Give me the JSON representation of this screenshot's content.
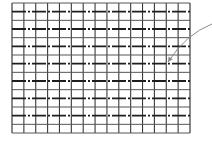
{
  "diagram": {
    "type": "grid-with-pointer-arrow",
    "canvas": {
      "width": 212,
      "height": 142,
      "background": "#ffffff"
    },
    "grid": {
      "left": 12,
      "top": 3,
      "right": 190,
      "bottom": 133,
      "columns": 15,
      "rows": 15,
      "dashed_row_lines": [
        1,
        3,
        5,
        7,
        9,
        11,
        13
      ],
      "line_color": "#3a3a3a",
      "thin_line_color": "#555555",
      "dash_color": "#1e1e1e"
    },
    "arrow": {
      "start": [
        212,
        24
      ],
      "control": [
        186,
        34
      ],
      "end": [
        168,
        62
      ],
      "color": "#8a8a8a"
    }
  }
}
